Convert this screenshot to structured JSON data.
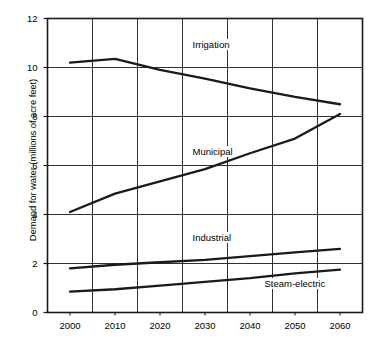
{
  "chart_data": {
    "type": "line",
    "title": "",
    "xlabel": "",
    "ylabel": "Demand for water (millions of acre feet)",
    "x": [
      2000,
      2010,
      2020,
      2030,
      2040,
      2050,
      2060
    ],
    "xlim": [
      1995,
      2065
    ],
    "ylim": [
      0,
      12
    ],
    "yticks": [
      0,
      2,
      4,
      6,
      8,
      10,
      12
    ],
    "xticks": [
      2000,
      2010,
      2020,
      2030,
      2040,
      2050,
      2060
    ],
    "grid": true,
    "legend_position": "inline-labels",
    "line_color": "#1a1a1a",
    "series": [
      {
        "name": "Irrigation",
        "values": [
          10.2,
          10.35,
          9.9,
          9.55,
          9.15,
          8.8,
          8.5
        ],
        "label_x": 2027,
        "label_y": 10.9
      },
      {
        "name": "Municipal",
        "values": [
          4.1,
          4.85,
          5.35,
          5.85,
          6.5,
          7.1,
          8.1
        ],
        "label_x": 2027,
        "label_y": 6.55
      },
      {
        "name": "Industrial",
        "values": [
          1.8,
          1.95,
          2.05,
          2.15,
          2.3,
          2.45,
          2.6
        ],
        "label_x": 2027,
        "label_y": 3.05
      },
      {
        "name": "Steam-electric",
        "values": [
          0.85,
          0.95,
          1.1,
          1.25,
          1.4,
          1.6,
          1.75
        ],
        "label_x": 2043,
        "label_y": 1.15
      }
    ],
    "ytick_labels": [
      "0",
      "2",
      "4",
      "6",
      "8",
      "10",
      "12"
    ],
    "xtick_labels": [
      "2000",
      "2010",
      "2020",
      "2030",
      "2040",
      "2050",
      "2060"
    ]
  }
}
